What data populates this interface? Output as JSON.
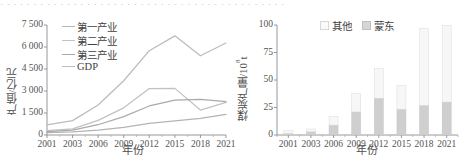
{
  "page": {
    "top_cut_text": "· · · · · · · · · · · · · · · · · · · · · · · · · · · · · · · · · · · · · · · · · · ·"
  },
  "chart_data": [
    {
      "id": "left",
      "type": "line",
      "title": "",
      "xlabel": "年份",
      "ylabel": "产值/亿元",
      "x": [
        2001,
        2003,
        2006,
        2009,
        2012,
        2015,
        2018,
        2021
      ],
      "xticklabels": [
        "2001",
        "2003",
        "2006",
        "2009",
        "2012",
        "2015",
        "2018",
        "2021"
      ],
      "yticklabels": [
        "0",
        "1 500",
        "3 000",
        "4 500",
        "6 000",
        "7 500"
      ],
      "ylim": [
        0,
        7500
      ],
      "yticks": [
        0,
        1500,
        3000,
        4500,
        6000,
        7500
      ],
      "grid": false,
      "legend_position": "upper-left",
      "series": [
        {
          "name": "第一产业",
          "color": "#b4b4b4",
          "values": [
            170,
            210,
            330,
            520,
            790,
            960,
            1130,
            1400
          ]
        },
        {
          "name": "第二产业",
          "color": "#c2c2c2",
          "values": [
            290,
            420,
            1000,
            1850,
            3170,
            3180,
            1700,
            2230
          ]
        },
        {
          "name": "第三产业",
          "color": "#aaaaaa",
          "values": [
            230,
            330,
            700,
            1250,
            1980,
            2380,
            2430,
            2280
          ]
        },
        {
          "name": "GDP",
          "color": "#bcbcbc",
          "values": [
            690,
            980,
            2050,
            3700,
            5750,
            6760,
            5400,
            6270
          ]
        }
      ]
    },
    {
      "id": "right",
      "type": "bar",
      "stacked": true,
      "title": "",
      "xlabel": "年份",
      "ylabel_parts": {
        "text": "煤炭产量/10",
        "sup": "8",
        "unit": "t"
      },
      "ylabel": "煤炭产量/10^8 t",
      "categories": [
        "2001",
        "2003",
        "2006",
        "2009",
        "2012",
        "2015",
        "2018",
        "2021"
      ],
      "yticklabels": [
        "0",
        "25",
        "50",
        "75",
        "100"
      ],
      "yticks": [
        0,
        25,
        50,
        75,
        100
      ],
      "ylim": [
        0,
        100
      ],
      "grid": false,
      "legend_position": "top-center",
      "series": [
        {
          "name": "蒙东",
          "color": "#cfcfcf",
          "values": [
            1.5,
            3.0,
            9.0,
            21.0,
            33.5,
            23.5,
            27.0,
            30.0
          ]
        },
        {
          "name": "其他",
          "color": "#f7f7f7",
          "values": [
            2.5,
            2.5,
            8.0,
            17.0,
            27.0,
            21.5,
            70.0,
            69.5
          ]
        }
      ],
      "totals": [
        4.0,
        5.5,
        17.0,
        38.0,
        60.5,
        45.0,
        97.0,
        99.5
      ]
    }
  ]
}
